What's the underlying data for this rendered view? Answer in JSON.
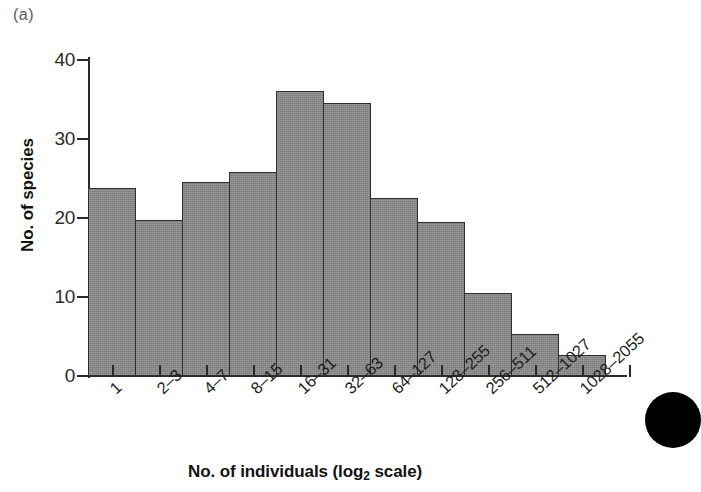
{
  "figure": {
    "panel_label": "(a)",
    "artifact": "scan-blob"
  },
  "chart_data": {
    "type": "bar",
    "title": "",
    "subtitle": "",
    "xlabel": "No. of individuals (log2 scale)",
    "xlabel_parts": {
      "pre": "No. of individuals (log",
      "sub": "2",
      "post": " scale)"
    },
    "ylabel": "No. of species",
    "categories": [
      "1",
      "2–3",
      "4–7",
      "8–15",
      "16–31",
      "32–63",
      "64–127",
      "128–255",
      "256–511",
      "512–1027",
      "1028–2055"
    ],
    "values": [
      23.8,
      19.8,
      24.6,
      25.8,
      36.1,
      34.6,
      22.5,
      19.5,
      10.5,
      5.3,
      2.6
    ],
    "ylim": [
      0,
      40
    ],
    "yticks": [
      0,
      10,
      20,
      30,
      40
    ],
    "ytick_labels": [
      "0",
      "10",
      "20",
      "30",
      "40"
    ],
    "grid": false,
    "legend": null,
    "bar_color": "#8a8a8a",
    "bar_edge_color": "#2e2e2e",
    "axis_color": "#2a2a2a",
    "background": "#ffffff"
  }
}
